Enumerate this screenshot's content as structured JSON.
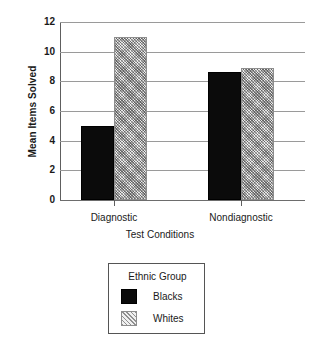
{
  "chart_data": {
    "type": "bar",
    "title": "",
    "categories": [
      "Diagnostic",
      "Nondiagnostic"
    ],
    "series": [
      {
        "name": "Blacks",
        "values": [
          5.0,
          8.6
        ],
        "fill": "solid-black",
        "color": "#0b0b0b"
      },
      {
        "name": "Whites",
        "values": [
          11.0,
          8.9
        ],
        "fill": "diagonal-hatch",
        "color": "#e9e9e9"
      }
    ],
    "xlabel": "Test Conditions",
    "ylabel": "Mean Items Solved",
    "ylim": [
      0,
      12
    ],
    "yticks": [
      0,
      2,
      4,
      6,
      8,
      10,
      12
    ],
    "ytick_labels": [
      "0",
      "2",
      "4",
      "6",
      "8",
      "10",
      "12"
    ],
    "grid": true,
    "grid_axis": "y",
    "legend": {
      "title": "Ethnic Group",
      "position": "below-plot",
      "entries": [
        {
          "label": "Blacks",
          "swatch": "solid-black"
        },
        {
          "label": "Whites",
          "swatch": "diagonal-hatch"
        }
      ]
    }
  }
}
